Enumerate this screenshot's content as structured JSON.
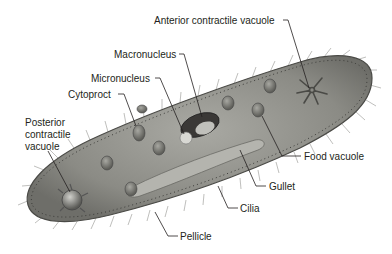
{
  "diagram": {
    "labels": [
      {
        "id": "anterior-contractile-vacuole",
        "text": "Anterior contractile vacuole"
      },
      {
        "id": "macronucleus",
        "text": "Macronucleus"
      },
      {
        "id": "micronucleus",
        "text": "Micronucleus"
      },
      {
        "id": "cytoproct",
        "text": "Cytoproct"
      },
      {
        "id": "posterior-contractile-vacuole",
        "lines": [
          "Posterior",
          "contractile",
          "vacuole"
        ]
      },
      {
        "id": "food-vacuole",
        "text": "Food vacuole"
      },
      {
        "id": "gullet",
        "text": "Gullet"
      },
      {
        "id": "cilia",
        "text": "Cilia"
      },
      {
        "id": "pellicle",
        "text": "Pellicle"
      }
    ],
    "colors": {
      "body_fill": "#8a8a84",
      "body_edge": "#4a4a46",
      "cilia": "#6b6b66",
      "label_text": "#231f20",
      "leader_line": "#231f20"
    }
  }
}
